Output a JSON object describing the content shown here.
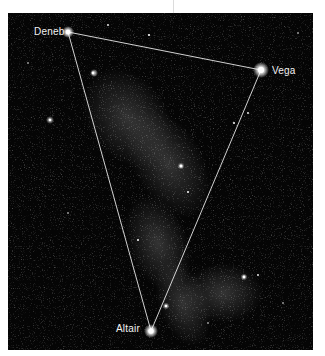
{
  "figure": {
    "background_color": "#050505",
    "line_color": "#e8e8e8",
    "stars": [
      {
        "name": "Deneb",
        "label": "Deneb",
        "x": 68,
        "y": 32
      },
      {
        "name": "Vega",
        "label": "Vega",
        "x": 261,
        "y": 70
      },
      {
        "name": "Altair",
        "label": "Altair",
        "x": 151,
        "y": 331
      }
    ]
  }
}
